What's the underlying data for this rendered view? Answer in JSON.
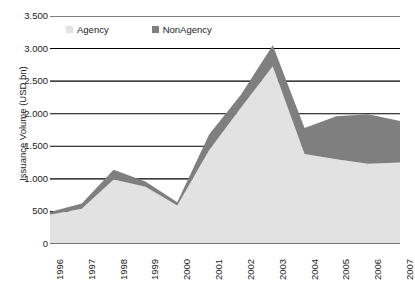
{
  "chart_data": {
    "type": "area",
    "stacked": true,
    "title": "",
    "xlabel": "",
    "ylabel": "Issuance Volume (USD bn)",
    "categories": [
      "1996",
      "1997",
      "1998",
      "1999",
      "2000",
      "2001",
      "2002",
      "2003",
      "2004",
      "2005",
      "2006",
      "2007"
    ],
    "series": [
      {
        "name": "Agency",
        "color": "#e2e2e2",
        "values": [
          450,
          540,
          990,
          880,
          590,
          1440,
          2090,
          2730,
          1380,
          1300,
          1230,
          1250
        ]
      },
      {
        "name": "NonAgency",
        "color": "#7f7f7f",
        "values": [
          40,
          80,
          150,
          80,
          50,
          240,
          200,
          320,
          400,
          660,
          760,
          640
        ]
      }
    ],
    "totals": [
      490,
      620,
      1140,
      960,
      640,
      1680,
      2290,
      3050,
      1780,
      1960,
      1990,
      1890
    ],
    "ylim": [
      0,
      3500
    ],
    "ytick_values": [
      0,
      500,
      1000,
      1500,
      2000,
      2500,
      3000,
      3500
    ],
    "ytick_labels": [
      "0",
      "500",
      "1.000",
      "1.500",
      "2.000",
      "2.500",
      "3.000",
      "3.500"
    ],
    "grid": true,
    "grid_color": "#000000",
    "legend_position": "top-inside",
    "legend": [
      "Agency",
      "NonAgency"
    ]
  },
  "axis": {
    "y_title": "Issuance Volume (USD bn)"
  },
  "legend": {
    "agency_label": "Agency",
    "nonagency_label": "NonAgency",
    "agency_color": "#e2e2e2",
    "nonagency_color": "#7f7f7f"
  }
}
